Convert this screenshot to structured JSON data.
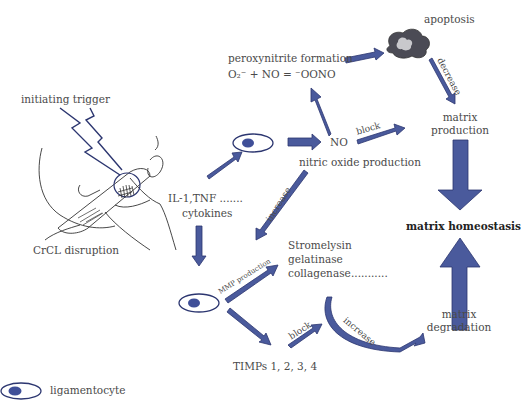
{
  "colors": {
    "arrow_fill": "#4a5a9c",
    "arrow_stroke": "#2c3670",
    "nucleus": "#3f4f98",
    "text": "#4a4a4a",
    "sketch": "#333333",
    "apoptosis_dark": "#4b4b55",
    "apoptosis_light": "#c8c8cc"
  },
  "labels": {
    "initiating_trigger": "initiating trigger",
    "crcl_disruption": "CrCL disruption",
    "cytokines_line1": "IL-1,TNF .......",
    "cytokines_line2": "cytokines",
    "peroxynitrite_formation": "peroxynitrite formation",
    "peroxynitrite_equation": "O₂⁻ + NO = ⁻OONO",
    "apoptosis": "apoptosis",
    "decrease": "decrease",
    "no": "NO",
    "block_top": "block",
    "nitric_oxide_production": "nitric oxide production",
    "matrix_production_line1": "matrix",
    "matrix_production_line2": "production",
    "increase_left": "increase",
    "matrix_homeostasis": "matrix homeostasis",
    "mmp_production": "MMP production",
    "stromelysin": "Stromelysin",
    "gelatinase": "gelatinase",
    "collagenase": "collagenase",
    "ellipsis": "...........",
    "block_bottom": "block",
    "increase_curve": "increase",
    "matrix_degradation_line1": "matrix",
    "matrix_degradation_line2": "degradation",
    "timps": "TIMPs 1, 2, 3, 4",
    "legend_ligamentocyte": "ligamentocyte"
  }
}
